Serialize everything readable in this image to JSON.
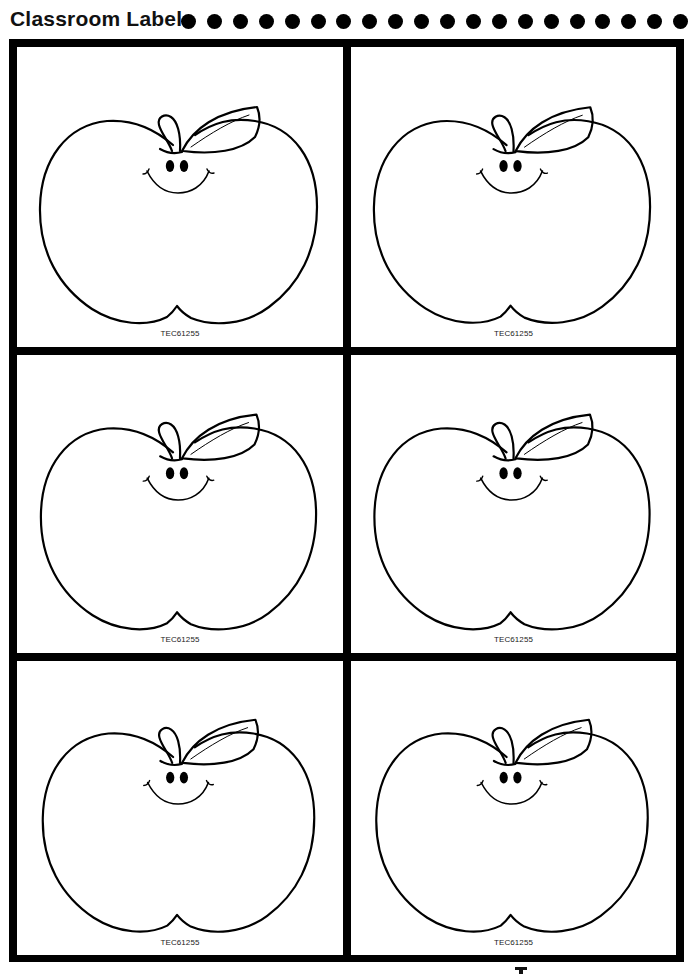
{
  "header": {
    "title": "Classroom Labels",
    "dot_count": 20
  },
  "cards": [
    {
      "code": "TEC61255"
    },
    {
      "code": "TEC61255"
    },
    {
      "code": "TEC61255"
    },
    {
      "code": "TEC61255"
    },
    {
      "code": "TEC61255"
    },
    {
      "code": "TEC61255"
    }
  ],
  "colors": {
    "ink": "#000000",
    "paper": "#ffffff"
  }
}
